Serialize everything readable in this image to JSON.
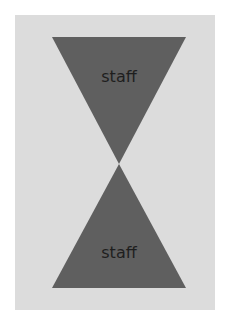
{
  "diagram": {
    "type": "hourglass",
    "colors": {
      "page_background": "#ffffff",
      "panel_background": "#dcdcdc",
      "triangle_fill": "#5f5f5f",
      "label_color": "#1e1e1e"
    },
    "top_triangle": {
      "label": "staff",
      "orientation": "pointing-down"
    },
    "bottom_triangle": {
      "label": "staff",
      "orientation": "pointing-up"
    }
  }
}
